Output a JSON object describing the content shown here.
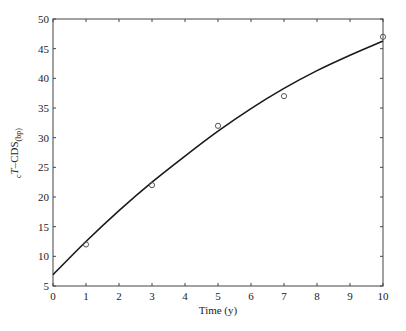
{
  "chart_data": {
    "type": "scatter",
    "title": "",
    "xlabel": "Time (y)",
    "ylabel": "cT–CDS(bp)",
    "ylabel_parts": {
      "pre_sub": "c",
      "main_italic": "T",
      "rest": "–CDS",
      "sub": "(bp)"
    },
    "xlim": [
      0,
      10
    ],
    "ylim": [
      5,
      50
    ],
    "xticks": [
      0,
      1,
      2,
      3,
      4,
      5,
      6,
      7,
      8,
      9,
      10
    ],
    "yticks": [
      5,
      10,
      15,
      20,
      25,
      30,
      35,
      40,
      45,
      50
    ],
    "grid": false,
    "legend": null,
    "series": [
      {
        "name": "observed",
        "marker": "circle-open",
        "x": [
          1,
          3,
          5,
          7,
          10
        ],
        "y": [
          12,
          22,
          32,
          37,
          47
        ]
      },
      {
        "name": "fitted curve",
        "style": "line",
        "x": [
          0,
          1,
          2,
          3,
          4,
          5,
          6,
          7,
          8,
          9,
          10
        ],
        "y": [
          6.9,
          12.5,
          17.7,
          22.5,
          26.9,
          31.1,
          34.9,
          38.3,
          41.3,
          43.9,
          46.3
        ]
      }
    ]
  }
}
